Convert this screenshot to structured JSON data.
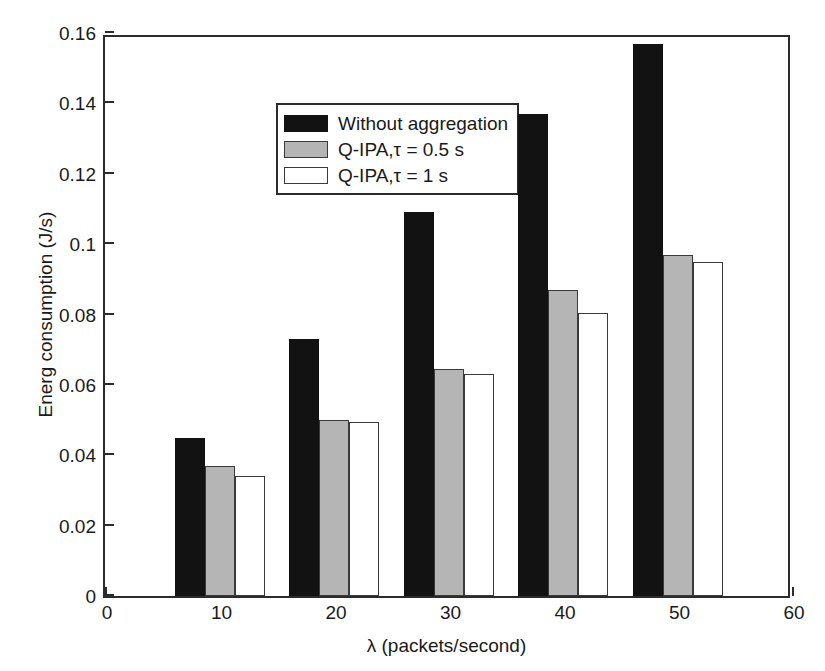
{
  "chart_data": {
    "type": "bar",
    "title": "",
    "xlabel": "λ (packets/second)",
    "ylabel": "Energ consumption (J/s)",
    "categories": [
      10,
      20,
      30,
      40,
      50
    ],
    "xtick_labels": [
      "0",
      "10",
      "20",
      "30",
      "40",
      "50",
      "60"
    ],
    "xticks": [
      0,
      10,
      20,
      30,
      40,
      50,
      60
    ],
    "xlim": [
      0,
      60
    ],
    "ytick_labels": [
      "0",
      "0.02",
      "0.04",
      "0.06",
      "0.08",
      "0.1",
      "0.12",
      "0.14",
      "0.16"
    ],
    "yticks": [
      0,
      0.02,
      0.04,
      0.06,
      0.08,
      0.1,
      0.12,
      0.14,
      0.16
    ],
    "ylim": [
      0,
      0.16
    ],
    "grid": false,
    "legend_position": "upper left inside",
    "series": [
      {
        "name": "Without aggregation",
        "color": "#121212",
        "values": [
          0.045,
          0.073,
          0.109,
          0.137,
          0.157
        ]
      },
      {
        "name": "Q-IPA,τ = 0.5 s",
        "color": "#b5b5b5",
        "values": [
          0.037,
          0.05,
          0.0645,
          0.087,
          0.097
        ]
      },
      {
        "name": "Q-IPA,τ = 1 s",
        "color": "#ffffff",
        "values": [
          0.034,
          0.0495,
          0.063,
          0.0805,
          0.095
        ]
      }
    ]
  }
}
